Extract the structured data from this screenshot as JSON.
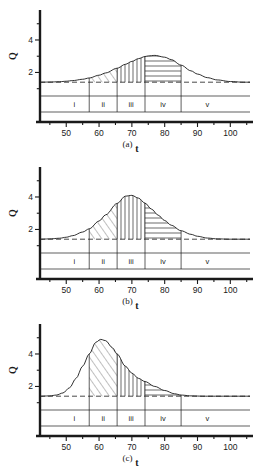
{
  "figure": {
    "panels": [
      {
        "caption": "(a)",
        "xlabel": "t",
        "ylabel": "Q",
        "xticks": [
          50,
          60,
          70,
          80,
          90,
          100
        ],
        "yticks": [
          2,
          4
        ],
        "regions": [
          "i",
          "ii",
          "iii",
          "iv",
          "v"
        ],
        "region_bounds": [
          57,
          65.5,
          74,
          85
        ],
        "baseline": 1.4,
        "peak_value": 3.05,
        "peak_t": 75,
        "width_sigma": 11.5,
        "hatch": {
          "ii": "diagonal",
          "iii": "vertical",
          "iv": "horizontal"
        }
      },
      {
        "caption": "(b)",
        "xlabel": "t",
        "ylabel": "Q",
        "xticks": [
          50,
          60,
          70,
          80,
          90,
          100
        ],
        "yticks": [
          2,
          4
        ],
        "regions": [
          "i",
          "ii",
          "iii",
          "iv",
          "v"
        ],
        "region_bounds": [
          57,
          65.5,
          74,
          85
        ],
        "baseline": 1.4,
        "peak_value": 4.1,
        "peak_t": 68,
        "width_sigma": 9.5,
        "hatch": {
          "ii": "diagonal",
          "iii": "vertical",
          "iv": "horizontal"
        }
      },
      {
        "caption": "(c)",
        "xlabel": "t",
        "ylabel": "Q",
        "xticks": [
          50,
          60,
          70,
          80,
          90,
          100
        ],
        "yticks": [
          2,
          4
        ],
        "regions": [
          "i",
          "ii",
          "iii",
          "iv",
          "v"
        ],
        "region_bounds": [
          57,
          65.5,
          74,
          85
        ],
        "baseline": 1.4,
        "peak_value": 4.9,
        "peak_t": 60.5,
        "width_sigma": 7.2,
        "hatch": {
          "ii": "diagonal",
          "iii": "vertical",
          "iv": "horizontal"
        }
      }
    ]
  },
  "chart_data": [
    {
      "type": "line",
      "title": "(a)",
      "xlabel": "t",
      "ylabel": "Q",
      "xlim": [
        42,
        106
      ],
      "ylim": [
        0.55,
        5.6
      ],
      "xticks": [
        50,
        60,
        70,
        80,
        90,
        100
      ],
      "yticks": [
        2,
        4
      ],
      "grid": false,
      "legend": null,
      "baseline": 1.4,
      "annotations": [
        "i",
        "ii",
        "iii",
        "iv",
        "v"
      ],
      "region_bounds": [
        57,
        65.5,
        74,
        85
      ],
      "x": [
        42,
        45,
        48,
        50,
        52,
        55,
        57,
        60,
        62,
        65.5,
        68,
        70,
        72,
        74,
        75,
        77,
        80,
        82,
        85,
        88,
        90,
        93,
        96,
        100,
        104,
        106
      ],
      "values": [
        1.4,
        1.41,
        1.43,
        1.46,
        1.5,
        1.58,
        1.66,
        1.83,
        1.97,
        2.26,
        2.5,
        2.68,
        2.85,
        2.98,
        3.02,
        3.05,
        2.94,
        2.79,
        2.45,
        2.1,
        1.9,
        1.68,
        1.54,
        1.44,
        1.4,
        1.4
      ]
    },
    {
      "type": "line",
      "title": "(b)",
      "xlabel": "t",
      "ylabel": "Q",
      "xlim": [
        42,
        106
      ],
      "ylim": [
        0.55,
        5.6
      ],
      "xticks": [
        50,
        60,
        70,
        80,
        90,
        100
      ],
      "yticks": [
        2,
        4
      ],
      "grid": false,
      "legend": null,
      "baseline": 1.4,
      "annotations": [
        "i",
        "ii",
        "iii",
        "iv",
        "v"
      ],
      "region_bounds": [
        57,
        65.5,
        74,
        85
      ],
      "x": [
        42,
        45,
        48,
        50,
        52,
        55,
        57,
        60,
        62,
        65.5,
        68,
        70,
        72,
        74,
        76,
        78,
        80,
        82,
        85,
        88,
        90,
        93,
        96,
        100,
        104,
        106
      ],
      "values": [
        1.4,
        1.42,
        1.46,
        1.52,
        1.62,
        1.84,
        2.04,
        2.52,
        2.9,
        3.6,
        4.05,
        4.1,
        3.93,
        3.62,
        3.25,
        2.88,
        2.55,
        2.26,
        1.92,
        1.7,
        1.58,
        1.47,
        1.42,
        1.4,
        1.4,
        1.4
      ]
    },
    {
      "type": "line",
      "title": "(c)",
      "xlabel": "t",
      "ylabel": "Q",
      "xlim": [
        42,
        106
      ],
      "ylim": [
        0.55,
        5.6
      ],
      "xticks": [
        50,
        60,
        70,
        80,
        90,
        100
      ],
      "yticks": [
        2,
        4
      ],
      "grid": false,
      "legend": null,
      "baseline": 1.4,
      "annotations": [
        "i",
        "ii",
        "iii",
        "iv",
        "v"
      ],
      "region_bounds": [
        57,
        65.5,
        74,
        85
      ],
      "x": [
        42,
        45,
        47,
        49,
        51,
        53,
        55,
        57,
        59,
        60.5,
        62,
        64,
        65.5,
        68,
        70,
        72,
        74,
        77,
        80,
        83,
        85,
        88,
        92,
        96,
        100,
        106
      ],
      "values": [
        1.4,
        1.42,
        1.47,
        1.6,
        1.92,
        2.5,
        3.25,
        4.0,
        4.72,
        4.9,
        4.82,
        4.4,
        4.0,
        3.25,
        2.82,
        2.5,
        2.3,
        2.0,
        1.75,
        1.55,
        1.47,
        1.42,
        1.4,
        1.4,
        1.4,
        1.4
      ]
    }
  ]
}
